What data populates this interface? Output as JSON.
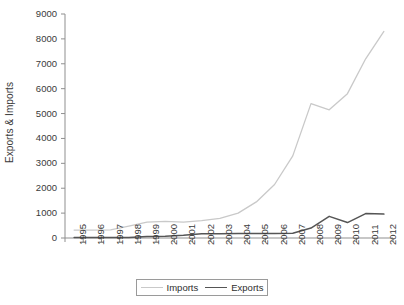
{
  "chart_data": {
    "type": "line",
    "title": "",
    "xlabel": "",
    "ylabel": "Exports & Imports",
    "ylim": [
      0,
      9000
    ],
    "ytick_labels": [
      "0",
      "1000",
      "2000",
      "3000",
      "4000",
      "5000",
      "6000",
      "7000",
      "8000",
      "9000"
    ],
    "yticks": [
      0,
      1000,
      2000,
      3000,
      4000,
      5000,
      6000,
      7000,
      8000,
      9000
    ],
    "grid": false,
    "legend_position": "bottom",
    "categories": [
      "1995",
      "1996",
      "1997",
      "1998",
      "1999",
      "2000",
      "2001",
      "2002",
      "2003",
      "2004",
      "2005",
      "2006",
      "2007",
      "2008",
      "2009",
      "2010",
      "2011",
      "2012"
    ],
    "series": [
      {
        "name": "Imports",
        "color": "#c9c9c9",
        "values": [
          320,
          320,
          330,
          480,
          640,
          670,
          640,
          700,
          790,
          1000,
          1450,
          2150,
          3300,
          5400,
          5150,
          5800,
          7200,
          8300
        ]
      },
      {
        "name": "Exports",
        "color": "#555555",
        "values": [
          20,
          20,
          20,
          25,
          60,
          70,
          110,
          170,
          170,
          180,
          180,
          180,
          190,
          400,
          870,
          620,
          980,
          960
        ]
      }
    ]
  },
  "legend": {
    "items": [
      {
        "label": "Imports",
        "swatch": "line-light-gray"
      },
      {
        "label": "Exports",
        "swatch": "line-dark-gray"
      }
    ]
  },
  "axes": {
    "y_axis_title": "Exports & Imports"
  }
}
